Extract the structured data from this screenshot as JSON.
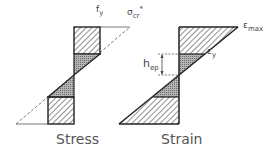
{
  "diagram": {
    "stress": {
      "caption": "Stress",
      "label_fy": "f",
      "label_fy_sub": "y",
      "label_sigma": "σ",
      "label_sigma_sub": "cr",
      "label_sigma_sup": "*"
    },
    "strain": {
      "caption": "Strain",
      "label_emax": "ε",
      "label_emax_sub": "max",
      "label_ey": "ε",
      "label_ey_sub": "y",
      "label_hep": "h",
      "label_hep_sub": "ep"
    },
    "colors": {
      "line": "#222222",
      "hatch": "#333333",
      "dense_fill": "#9a9a9a",
      "dashed": "#555555"
    }
  }
}
